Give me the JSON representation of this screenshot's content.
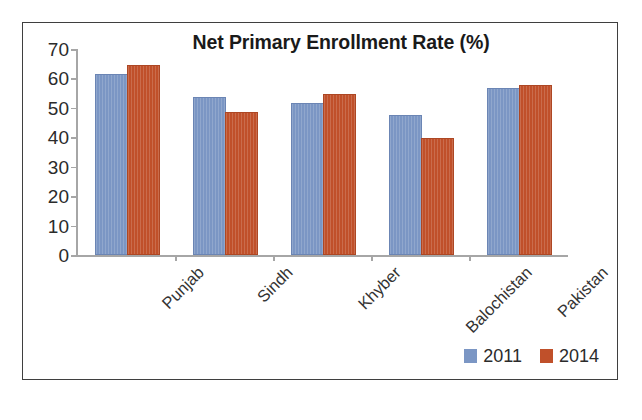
{
  "chart_data": {
    "type": "bar",
    "title": "Net Primary Enrollment Rate (%)",
    "xlabel": "",
    "ylabel": "",
    "ylim": [
      0,
      70
    ],
    "yticks": [
      0,
      10,
      20,
      30,
      40,
      50,
      60,
      70
    ],
    "ytick_labels": [
      "0",
      "10",
      "20",
      "30",
      "40",
      "50",
      "60",
      "70"
    ],
    "grid": false,
    "legend_position": "bottom-right",
    "categories": [
      "Punjab",
      "Sindh",
      "Khyber",
      "Balochistan",
      "Pakistan"
    ],
    "series": [
      {
        "name": "2011",
        "color": "#7b96c4",
        "values": [
          61,
          53,
          51,
          47,
          56
        ]
      },
      {
        "name": "2014",
        "color": "#c0502a",
        "values": [
          64,
          48,
          54,
          39,
          57
        ]
      }
    ]
  },
  "legend": {
    "items": [
      {
        "label": "2011",
        "color": "#7b96c4"
      },
      {
        "label": "2014",
        "color": "#c0502a"
      }
    ]
  }
}
